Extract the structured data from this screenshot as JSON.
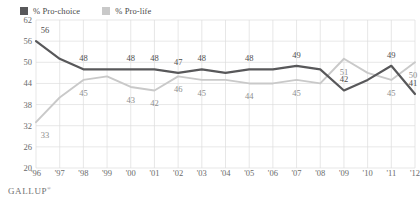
{
  "legend": {
    "items": [
      {
        "label": "% Pro-choice",
        "color": "#58585a",
        "icon": "legend-swatch-icon"
      },
      {
        "label": "% Pro-life",
        "color": "#c9c9c9",
        "icon": "legend-swatch-icon"
      }
    ]
  },
  "footer": {
    "source": "GALLUP",
    "trademark": "®"
  },
  "chart_data": {
    "type": "line",
    "title": "",
    "xlabel": "",
    "ylabel": "",
    "ylim": [
      20,
      62
    ],
    "yticks": [
      62,
      56,
      50,
      44,
      38,
      32,
      26,
      20
    ],
    "grid": true,
    "legend_position": "top-left",
    "categories": [
      "'96",
      "'97",
      "'98",
      "'99",
      "'00",
      "'01",
      "'02",
      "'03",
      "'04",
      "'05",
      "'06",
      "'07",
      "'08",
      "'09",
      "'10",
      "'11",
      "'12"
    ],
    "series": [
      {
        "name": "% Pro-choice",
        "color": "#58585a",
        "values": [
          56,
          51,
          48,
          48,
          48,
          48,
          47,
          48,
          47,
          48,
          48,
          49,
          48,
          42,
          45,
          49,
          41
        ],
        "point_labels": [
          {
            "x": "'96",
            "value": 56
          },
          {
            "x": "'98",
            "value": 48
          },
          {
            "x": "'00",
            "value": 48
          },
          {
            "x": "'01",
            "value": 48
          },
          {
            "x": "'02",
            "value": 47
          },
          {
            "x": "'03",
            "value": 48
          },
          {
            "x": "'05",
            "value": 48
          },
          {
            "x": "'07",
            "value": 49
          },
          {
            "x": "'09",
            "value": 42
          },
          {
            "x": "'11",
            "value": 49
          },
          {
            "x": "'12",
            "value": 41
          }
        ]
      },
      {
        "name": "% Pro-life",
        "color": "#c9c9c9",
        "values": [
          33,
          40,
          45,
          46,
          43,
          42,
          46,
          45,
          45,
          44,
          44,
          45,
          44,
          51,
          47,
          45,
          50
        ],
        "point_labels": [
          {
            "x": "'96",
            "value": 33
          },
          {
            "x": "'98",
            "value": 45
          },
          {
            "x": "'00",
            "value": 43
          },
          {
            "x": "'01",
            "value": 42
          },
          {
            "x": "'02",
            "value": 46
          },
          {
            "x": "'03",
            "value": 45
          },
          {
            "x": "'05",
            "value": 44
          },
          {
            "x": "'07",
            "value": 45
          },
          {
            "x": "'09",
            "value": 51
          },
          {
            "x": "'11",
            "value": 45
          },
          {
            "x": "'12",
            "value": 50
          }
        ]
      }
    ]
  }
}
